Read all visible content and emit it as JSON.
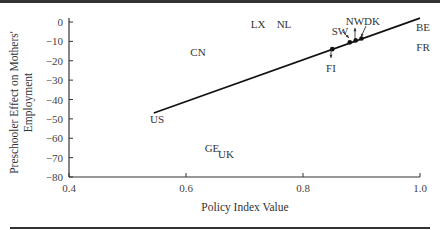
{
  "chart_data": {
    "type": "scatter",
    "title": "",
    "xlabel": "Policy Index Value",
    "ylabel": "Preschooler Effect on Mothers' Employment",
    "ylabel_lines": [
      "Preschooler Effect on Mothers'",
      "Employment"
    ],
    "xlim": [
      0.4,
      1.0
    ],
    "ylim": [
      -80,
      0
    ],
    "x_ticks": [
      "0.4",
      "0.6",
      "0.8",
      "1.0"
    ],
    "y_ticks": [
      "0",
      "−10",
      "−20",
      "−30",
      "−40",
      "−50",
      "−60",
      "−70",
      "−80"
    ],
    "grid": false,
    "points": [
      {
        "label": "LX",
        "x": 0.71,
        "y": -4
      },
      {
        "label": "NL",
        "x": 0.77,
        "y": -4
      },
      {
        "label": "CN",
        "x": 0.64,
        "y": -20
      },
      {
        "label": "US",
        "x": 0.55,
        "y": -48
      },
      {
        "label": "GE",
        "x": 0.64,
        "y": -65
      },
      {
        "label": "UK",
        "x": 0.66,
        "y": -69
      },
      {
        "label": "BE",
        "x": 1.0,
        "y": -7
      },
      {
        "label": "FR",
        "x": 1.0,
        "y": -18
      },
      {
        "label": "FI",
        "x": 0.85,
        "y": -14
      },
      {
        "label": "SW",
        "x": 0.88,
        "y": -10
      },
      {
        "label": "NW",
        "x": 0.89,
        "y": -9
      },
      {
        "label": "DK",
        "x": 0.9,
        "y": -8
      }
    ],
    "fit_line": {
      "x": [
        0.545,
        1.0
      ],
      "y": [
        -47,
        2
      ]
    },
    "fit_markers": [
      {
        "label": "FI",
        "x": 0.85,
        "y": -14
      },
      {
        "label": "SW",
        "x": 0.88,
        "y": -10.5
      },
      {
        "label": "NW",
        "x": 0.89,
        "y": -9.5
      },
      {
        "label": "DK",
        "x": 0.9,
        "y": -8.5
      }
    ]
  }
}
